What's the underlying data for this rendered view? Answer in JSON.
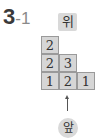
{
  "problem": {
    "number": "3",
    "sub": "-1"
  },
  "labels": {
    "top": "위",
    "front": "앞"
  },
  "grid": {
    "rows": [
      [
        "2",
        "",
        ""
      ],
      [
        "2",
        "3",
        ""
      ],
      [
        "1",
        "2",
        "1"
      ]
    ]
  },
  "colors": {
    "cell_fill": "#d6d6d6",
    "cell_border": "#9a9a9a",
    "label_fill": "#d9d9d9"
  }
}
